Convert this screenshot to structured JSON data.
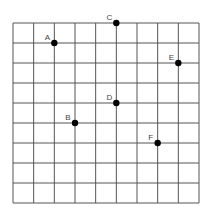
{
  "diagram": {
    "type": "coordinate-grid",
    "grid": {
      "columns": 9,
      "rows": 9,
      "left": 13,
      "top": 23,
      "right": 199,
      "bottom": 203,
      "line_color": "#555555"
    },
    "point_color": "#000000",
    "label_color": "#444444",
    "points": [
      {
        "label": "A",
        "col": 2,
        "row": 1
      },
      {
        "label": "C",
        "col": 5,
        "row": 0
      },
      {
        "label": "E",
        "col": 8,
        "row": 2
      },
      {
        "label": "D",
        "col": 5,
        "row": 4
      },
      {
        "label": "B",
        "col": 3,
        "row": 5
      },
      {
        "label": "F",
        "col": 7,
        "row": 6
      }
    ]
  }
}
